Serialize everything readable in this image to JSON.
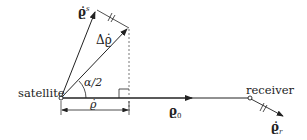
{
  "labels": {
    "satellite": "satellite",
    "receiver": "receiver",
    "rho_dot_s_main": "ϱ̇",
    "rho_dot_s_sup": "s",
    "delta_rho_dot": "Δϱ̇",
    "angle": "α/2",
    "rho_0_main": "ϱ",
    "rho_0_sub": "0",
    "rho_dot_r_main": "ϱ̇",
    "rho_dot_r_sub": "r",
    "rho_dot_scalar": "ϱ̇"
  },
  "colors": {
    "line": "#222222",
    "dashed": "#555555"
  }
}
